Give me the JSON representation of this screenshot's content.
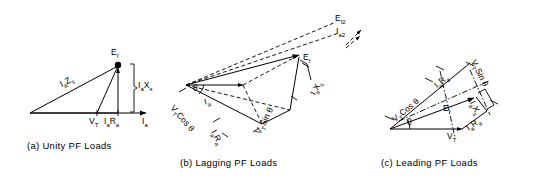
{
  "figure": {
    "background_color": "#ffffff",
    "line_color": "#000000"
  },
  "panels": [
    {
      "id": "a",
      "caption": "(a) Unity PF Loads",
      "labels": {
        "ef": "E",
        "ef_sub": "f",
        "ia_zs": "I",
        "ia_zs_sub1": "a",
        "ia_zs_mid": "Z",
        "ia_zs_sub2": "s",
        "vt": "V",
        "vt_sub": "T",
        "ia_ra": "I",
        "ia_ra_sub1": "a",
        "ia_ra_mid": "R",
        "ia_ra_sub2": "a",
        "ia_axis": "I",
        "ia_axis_sub": "a",
        "ia_xs": "I",
        "ia_xs_sub1": "a",
        "ia_xs_mid": "X",
        "ia_xs_sub2": "s"
      }
    },
    {
      "id": "b",
      "caption": "(b) Lagging PF Loads",
      "labels": {
        "ef": "E",
        "ef_sub": "f",
        "ef2": "E",
        "ef2_sub": "f2",
        "ia2": "I",
        "ia2_sub": "a2",
        "theta": "θ",
        "ia": "I",
        "ia_sub": "a",
        "vt_cos": "V",
        "vt_cos_sub": "T",
        "vt_cos_rest": "Cos θ",
        "ia_ra": "I",
        "ia_ra_sub1": "a",
        "ia_ra_mid": "R",
        "ia_ra_sub2": "a",
        "vt_sin": "V",
        "vt_sin_sub": "T",
        "vt_sin_rest": "Sin θ",
        "ia_xs": "I",
        "ia_xs_sub1": "a",
        "ia_xs_mid": "X",
        "ia_xs_sub2": "s"
      }
    },
    {
      "id": "c",
      "caption": "(c) Leading PF Loads",
      "labels": {
        "ef": "E",
        "ef_sub": "f",
        "theta": "θ",
        "vt": "V",
        "vt_sub": "T",
        "vt_cos": "V",
        "vt_cos_sub": "T",
        "vt_cos_rest": "Cos θ",
        "vt_sin": "V",
        "vt_sin_sub": "T",
        "vt_sin_rest": "Sin θ",
        "ia_ra_top": "I",
        "ia_ra_top_sub1": "a",
        "ia_ra_top_mid": "R",
        "ia_ra_top_sub2": "a",
        "ia_ra_bottom": "I",
        "ia_ra_bottom_sub1": "a",
        "ia_ra_bottom_mid": "R",
        "ia_ra_bottom_sub2": "a",
        "ia_xs": "I",
        "ia_xs_sub1": "a",
        "ia_xs_mid": "X",
        "ia_xs_sub2": "s"
      }
    }
  ]
}
